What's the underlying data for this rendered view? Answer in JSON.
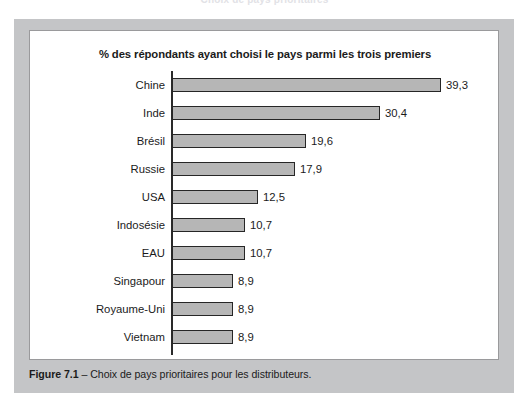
{
  "running_head": "Choix de pays prioritaires",
  "figure": {
    "caption_label": "Figure 7.1",
    "caption_text": "– Choix de pays prioritaires pour les distributeurs.",
    "panel_color": "#c4c5c7",
    "card_background": "#ffffff"
  },
  "chart_data": {
    "type": "bar",
    "orientation": "horizontal",
    "title": "% des répondants ayant choisi le pays parmi les trois premiers",
    "xlabel": "",
    "ylabel": "",
    "xlim": [
      0,
      45
    ],
    "grid": false,
    "legend": null,
    "value_suffix": "",
    "decimal_separator": ",",
    "bar_fill": "#b6b6b6",
    "bar_stroke": "#262626",
    "axis_color": "#2a2a2a",
    "categories": [
      "Chine",
      "Inde",
      "Brésil",
      "Russie",
      "USA",
      "Indosésie",
      "EAU",
      "Singapour",
      "Royaume-Uni",
      "Vietnam"
    ],
    "values": [
      39.3,
      30.4,
      19.6,
      17.9,
      12.5,
      10.7,
      10.7,
      8.9,
      8.9,
      8.9
    ],
    "value_labels": [
      "39,3",
      "30,4",
      "19,6",
      "17,9",
      "12,5",
      "10,7",
      "10,7",
      "8,9",
      "8,9",
      "8,9"
    ]
  }
}
